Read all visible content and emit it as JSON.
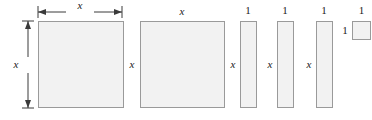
{
  "figure": {
    "width": 372,
    "height": 120,
    "background_color": "#ffffff",
    "tile_fill_color": "#f2f2f2",
    "tile_border_color": "#9a9a9a",
    "label_color": "#1a1a1a"
  },
  "labels": {
    "x": "x",
    "one": "1"
  },
  "dimension_lines": [
    {
      "name": "top-width-dimension",
      "orientation": "horizontal",
      "label": "x",
      "from_px": 38,
      "to_px": 122,
      "at_px": 11
    },
    {
      "name": "left-height-dimension",
      "orientation": "vertical",
      "label": "x",
      "from_px": 21,
      "to_px": 108,
      "at_px": 27
    }
  ],
  "tiles": [
    {
      "name": "x-squared-tile-1",
      "kind": "x-squared",
      "x": 38,
      "y": 21,
      "width": 86,
      "height": 87,
      "width_label": "x",
      "height_label": "x",
      "width_label_position": "dimension-arrow-top",
      "height_label_position": "dimension-arrow-left"
    },
    {
      "name": "x-squared-tile-2",
      "kind": "x-squared",
      "x": 140,
      "y": 21,
      "width": 85,
      "height": 87,
      "width_label": "x",
      "height_label": "x",
      "width_label_position": "above",
      "height_label_position": "left"
    },
    {
      "name": "x-tile-1",
      "kind": "x-by-one",
      "x": 240,
      "y": 21,
      "width": 17,
      "height": 87,
      "width_label": "1",
      "height_label": "x",
      "width_label_position": "above",
      "height_label_position": "left"
    },
    {
      "name": "x-tile-2",
      "kind": "x-by-one",
      "x": 277,
      "y": 21,
      "width": 17,
      "height": 87,
      "width_label": "1",
      "height_label": "x",
      "width_label_position": "above",
      "height_label_position": "left"
    },
    {
      "name": "x-tile-3",
      "kind": "x-by-one",
      "x": 316,
      "y": 21,
      "width": 17,
      "height": 87,
      "width_label": "1",
      "height_label": "x",
      "width_label_position": "above",
      "height_label_position": "left"
    },
    {
      "name": "unit-tile",
      "kind": "one-by-one",
      "x": 352,
      "y": 21,
      "width": 19,
      "height": 19,
      "width_label": "1",
      "height_label": "1",
      "width_label_position": "above",
      "height_label_position": "left"
    }
  ]
}
